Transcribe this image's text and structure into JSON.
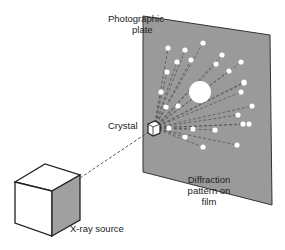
{
  "labels": {
    "plate": [
      "Photographic",
      "plate"
    ],
    "crystal": "Crystal",
    "pattern": [
      "Diffraction",
      "pattern on",
      "film"
    ],
    "source": "X-ray source"
  },
  "colors": {
    "plate_fill": "#9a9a9a",
    "spot": "#ffffff",
    "source_side": "#a0a0a0",
    "line": "#555555"
  },
  "crystal": {
    "x": 154,
    "y": 128
  },
  "spots": [
    [
      168,
      48
    ],
    [
      185,
      50
    ],
    [
      203,
      43
    ],
    [
      177,
      62
    ],
    [
      191,
      60
    ],
    [
      222,
      55
    ],
    [
      241,
      62
    ],
    [
      167,
      72
    ],
    [
      216,
      64
    ],
    [
      229,
      71
    ],
    [
      244,
      82
    ],
    [
      161,
      92
    ],
    [
      244,
      83
    ],
    [
      166,
      107
    ],
    [
      178,
      106
    ],
    [
      252,
      106
    ],
    [
      169,
      128
    ],
    [
      238,
      115
    ],
    [
      193,
      129
    ],
    [
      243,
      124
    ],
    [
      185,
      137
    ],
    [
      215,
      130
    ],
    [
      203,
      147
    ],
    [
      237,
      145
    ],
    [
      249,
      124
    ],
    [
      241,
      92
    ]
  ],
  "center_spot": {
    "x": 200,
    "y": 92,
    "r": 11
  }
}
